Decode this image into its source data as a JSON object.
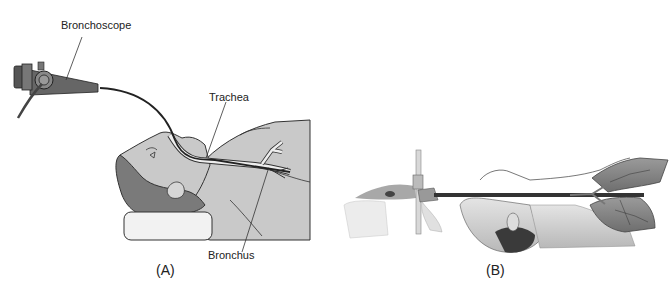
{
  "figure": {
    "panels": [
      {
        "id": "A",
        "caption": "(A)",
        "labels": {
          "bronchoscope": "Bronchoscope",
          "trachea": "Trachea",
          "bronchus": "Bronchus"
        }
      },
      {
        "id": "B",
        "caption": "(B)"
      }
    ],
    "colors": {
      "skin": "#c9c9c9",
      "hair": "#7a7a7a",
      "outline": "#333333",
      "airway": "#eeeeee",
      "scope": "#555555",
      "pillow": "#f2f2f2",
      "lung": "#8a8a8a"
    }
  }
}
